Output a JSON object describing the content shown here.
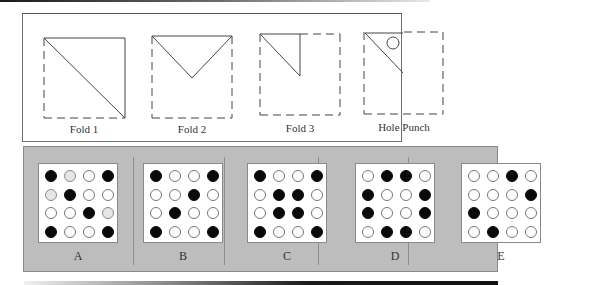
{
  "question": {
    "folds_panel": {
      "steps": [
        {
          "label": "Fold 1",
          "shape": "diagonal-fold"
        },
        {
          "label": "Fold 2",
          "shape": "v-fold"
        },
        {
          "label": "Fold 3",
          "shape": "corner-triangle"
        },
        {
          "label": "Hole Punch",
          "shape": "corner-triangle-with-hole"
        }
      ]
    },
    "options": [
      {
        "label": "A",
        "grid": [
          [
            "black",
            "gray",
            "white",
            "black"
          ],
          [
            "gray",
            "black",
            "white",
            "white"
          ],
          [
            "white",
            "white",
            "black",
            "gray"
          ],
          [
            "black",
            "white",
            "white",
            "black"
          ]
        ]
      },
      {
        "label": "B",
        "grid": [
          [
            "black",
            "white",
            "white",
            "black"
          ],
          [
            "white",
            "white",
            "black",
            "white"
          ],
          [
            "white",
            "black",
            "white",
            "white"
          ],
          [
            "black",
            "white",
            "white",
            "black"
          ]
        ]
      },
      {
        "label": "C",
        "grid": [
          [
            "black",
            "white",
            "white",
            "black"
          ],
          [
            "white",
            "black",
            "black",
            "white"
          ],
          [
            "white",
            "black",
            "black",
            "white"
          ],
          [
            "black",
            "white",
            "white",
            "black"
          ]
        ]
      },
      {
        "label": "D",
        "grid": [
          [
            "white",
            "black",
            "black",
            "white"
          ],
          [
            "black",
            "white",
            "white",
            "black"
          ],
          [
            "black",
            "white",
            "white",
            "black"
          ],
          [
            "white",
            "black",
            "black",
            "white"
          ]
        ]
      },
      {
        "label": "E",
        "grid": [
          [
            "white",
            "white",
            "black",
            "white"
          ],
          [
            "white",
            "white",
            "white",
            "black"
          ],
          [
            "black",
            "white",
            "white",
            "white"
          ],
          [
            "white",
            "black",
            "white",
            "white"
          ]
        ]
      }
    ]
  },
  "colors": {
    "panel_bg": "#bdbdbd",
    "hole_filled": "#0a0a0a",
    "hole_empty": "#ffffff",
    "hole_gray": "#e6e6e6"
  }
}
